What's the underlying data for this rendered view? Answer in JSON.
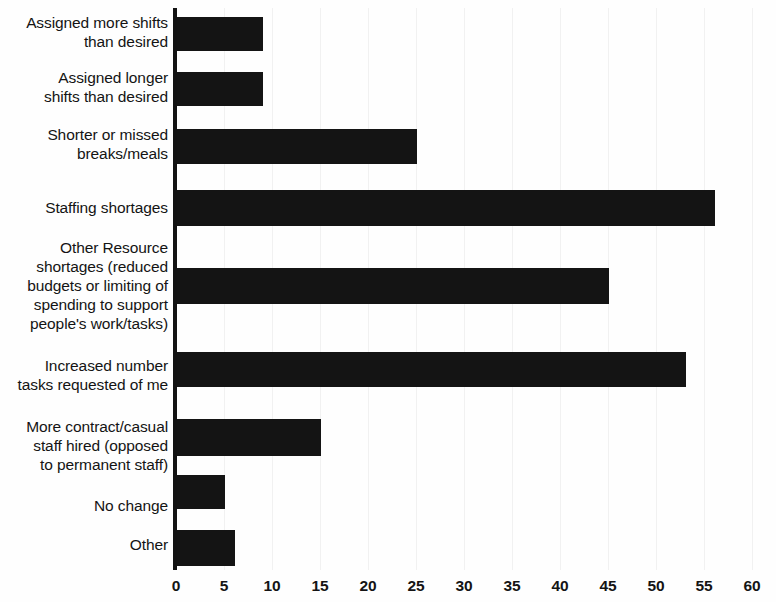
{
  "chart_data": {
    "type": "bar",
    "orientation": "horizontal",
    "title": "",
    "subtitle": "",
    "xlabel": "",
    "ylabel": "",
    "xlim": [
      0,
      60
    ],
    "xticks": [
      0,
      5,
      10,
      15,
      20,
      25,
      30,
      35,
      40,
      45,
      50,
      55,
      60
    ],
    "grid": true,
    "legend": null,
    "bar_color": "#141414",
    "background_color": "#fefefe",
    "axis_color": "#131313",
    "gridline_color": "#f1f1f1",
    "categories": [
      "Assigned more shifts than desired",
      "Assigned longer shifts than desired",
      "Shorter or missed breaks/meals",
      "Staffing shortages",
      "Other Resource shortages (reduced budgets or limiting of spending to support people's work/tasks)",
      "Increased number tasks requested of me",
      "More contract/casual staff hired (opposed to permanent staff)",
      "No change",
      "Other"
    ],
    "values": [
      9,
      9,
      25,
      56,
      45,
      53,
      15,
      5,
      6
    ],
    "bars": [
      {
        "label_lines": [
          "Assigned more shifts",
          "than desired"
        ],
        "value": 9,
        "top": 17,
        "height": 34,
        "label_top": 13
      },
      {
        "label_lines": [
          "Assigned longer",
          "shifts than desired"
        ],
        "value": 9,
        "top": 72,
        "height": 34,
        "label_top": 68
      },
      {
        "label_lines": [
          "Shorter or missed",
          "breaks/meals"
        ],
        "value": 25,
        "top": 129,
        "height": 35,
        "label_top": 125
      },
      {
        "label_lines": [
          "Staffing shortages"
        ],
        "value": 56,
        "top": 190,
        "height": 36,
        "label_top": 198
      },
      {
        "label_lines": [
          "Other Resource",
          "shortages (reduced",
          "budgets or limiting of",
          "spending to support",
          "people's work/tasks)"
        ],
        "value": 45,
        "top": 268,
        "height": 36,
        "label_top": 238
      },
      {
        "label_lines": [
          "Increased number",
          "tasks requested of me"
        ],
        "value": 53,
        "top": 352,
        "height": 35,
        "label_top": 356
      },
      {
        "label_lines": [
          "More contract/casual",
          "staff hired (opposed",
          "to permanent staff)"
        ],
        "value": 15,
        "top": 419,
        "height": 37,
        "label_top": 417
      },
      {
        "label_lines": [
          "No change"
        ],
        "value": 5,
        "top": 475,
        "height": 34,
        "label_top": 496
      },
      {
        "label_lines": [
          "Other"
        ],
        "value": 6,
        "top": 530,
        "height": 36,
        "label_top": 535
      }
    ]
  }
}
